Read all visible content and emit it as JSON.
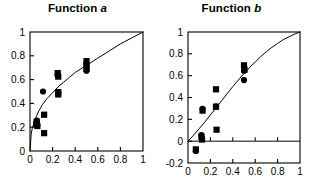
{
  "figure": {
    "background": "#ffffff",
    "ink_color": "#000000"
  },
  "chart_data": [
    {
      "type": "scatter",
      "title": "Function a",
      "title_plain": "Function ",
      "title_italic": "a",
      "xlabel": "",
      "ylabel": "",
      "xlim": [
        0,
        1
      ],
      "ylim": [
        0,
        1
      ],
      "xticks": [
        0,
        0.2,
        0.4,
        0.6,
        0.8,
        1
      ],
      "xticklabels": [
        "0",
        "0.2",
        "0.4",
        "0.6",
        "0.8",
        "1"
      ],
      "yticks": [
        0,
        0.2,
        0.4,
        0.6,
        0.8,
        1
      ],
      "yticklabels": [
        "0",
        "0.2",
        "0.4",
        "0.6",
        "0.8",
        "1"
      ],
      "grid": false,
      "legend": "none",
      "frame": "box",
      "series": [
        {
          "name": "squares",
          "marker": "square",
          "color": "#000000",
          "points": [
            [
              0.055,
              0.225
            ],
            [
              0.06,
              0.245
            ],
            [
              0.065,
              0.21
            ],
            [
              0.125,
              0.305
            ],
            [
              0.125,
              0.15
            ],
            [
              0.245,
              0.655
            ],
            [
              0.25,
              0.625
            ],
            [
              0.25,
              0.495
            ],
            [
              0.25,
              0.475
            ],
            [
              0.5,
              0.755
            ],
            [
              0.5,
              0.72
            ],
            [
              0.5,
              0.69
            ]
          ]
        },
        {
          "name": "circles",
          "marker": "circle",
          "color": "#000000",
          "points": [
            [
              0.06,
              0.255
            ],
            [
              0.065,
              0.215
            ],
            [
              0.115,
              0.5
            ],
            [
              0.245,
              0.635
            ],
            [
              0.25,
              0.49
            ],
            [
              0.5,
              0.73
            ],
            [
              0.5,
              0.675
            ]
          ]
        }
      ],
      "fit_curve": {
        "name": "fitted-curve-a",
        "description": "concave increasing curve through origin to (1,1)",
        "exponent": 0.42,
        "points": [
          [
            0.0,
            0.0
          ],
          [
            0.01,
            0.14
          ],
          [
            0.02,
            0.19
          ],
          [
            0.04,
            0.25
          ],
          [
            0.06,
            0.3
          ],
          [
            0.08,
            0.34
          ],
          [
            0.11,
            0.39
          ],
          [
            0.15,
            0.44
          ],
          [
            0.2,
            0.49
          ],
          [
            0.25,
            0.54
          ],
          [
            0.3,
            0.58
          ],
          [
            0.35,
            0.62
          ],
          [
            0.4,
            0.66
          ],
          [
            0.45,
            0.69
          ],
          [
            0.5,
            0.72
          ],
          [
            0.6,
            0.78
          ],
          [
            0.7,
            0.84
          ],
          [
            0.8,
            0.9
          ],
          [
            0.9,
            0.95
          ],
          [
            1.0,
            1.0
          ]
        ]
      }
    },
    {
      "type": "scatter",
      "title": "Function b",
      "title_plain": "Function ",
      "title_italic": "b",
      "xlabel": "",
      "ylabel": "",
      "xlim": [
        0,
        1
      ],
      "ylim": [
        -0.2,
        1
      ],
      "xticks": [
        0,
        0.2,
        0.4,
        0.6,
        0.8,
        1
      ],
      "xticklabels": [
        "0",
        "0.2",
        "0.4",
        "0.6",
        "0.8",
        "1"
      ],
      "yticks": [
        -0.2,
        0,
        0.2,
        0.4,
        0.6,
        0.8,
        1
      ],
      "yticklabels": [
        "-0.2",
        "0",
        "0.2",
        "0.4",
        "0.6",
        "0.8",
        "1"
      ],
      "grid": false,
      "legend": "none",
      "frame": "box",
      "series": [
        {
          "name": "squares",
          "marker": "square",
          "color": "#000000",
          "points": [
            [
              0.07,
              -0.075
            ],
            [
              0.12,
              0.04
            ],
            [
              0.125,
              0.015
            ],
            [
              0.13,
              0.28
            ],
            [
              0.25,
              0.475
            ],
            [
              0.255,
              0.105
            ],
            [
              0.25,
              0.315
            ],
            [
              0.5,
              0.695
            ],
            [
              0.505,
              0.655
            ]
          ]
        },
        {
          "name": "circles",
          "marker": "circle",
          "color": "#000000",
          "points": [
            [
              0.07,
              -0.09
            ],
            [
              0.12,
              0.055
            ],
            [
              0.125,
              0.02
            ],
            [
              0.13,
              0.295
            ],
            [
              0.25,
              0.32
            ],
            [
              0.5,
              0.645
            ],
            [
              0.5,
              0.56
            ]
          ]
        }
      ],
      "fit_curve": {
        "name": "fitted-curve-b",
        "description": "concave increasing curve through origin to (1,1)",
        "exponent": 0.78,
        "points": [
          [
            0.0,
            0.0
          ],
          [
            0.05,
            0.055
          ],
          [
            0.1,
            0.115
          ],
          [
            0.15,
            0.175
          ],
          [
            0.2,
            0.24
          ],
          [
            0.25,
            0.305
          ],
          [
            0.3,
            0.37
          ],
          [
            0.35,
            0.435
          ],
          [
            0.4,
            0.5
          ],
          [
            0.45,
            0.56
          ],
          [
            0.5,
            0.62
          ],
          [
            0.55,
            0.675
          ],
          [
            0.6,
            0.725
          ],
          [
            0.65,
            0.775
          ],
          [
            0.7,
            0.82
          ],
          [
            0.75,
            0.86
          ],
          [
            0.8,
            0.895
          ],
          [
            0.85,
            0.93
          ],
          [
            0.9,
            0.955
          ],
          [
            0.95,
            0.98
          ],
          [
            1.0,
            1.0
          ]
        ]
      }
    }
  ]
}
